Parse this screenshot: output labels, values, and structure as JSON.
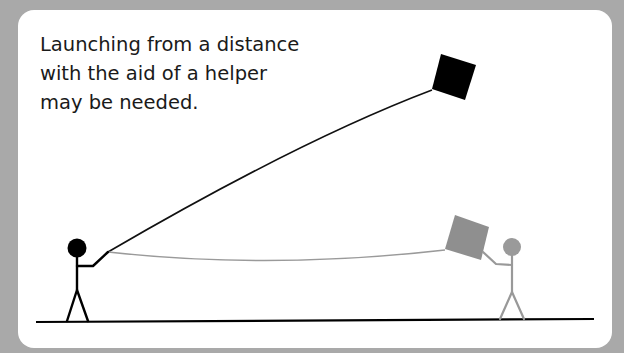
{
  "caption": {
    "lines": [
      "Launching from a distance",
      "with the aid of a helper",
      "may be needed."
    ]
  },
  "figures": {
    "launcher": {
      "label": "launcher-stick-figure",
      "color": "#000000"
    },
    "helper": {
      "label": "helper-stick-figure",
      "color": "#999999"
    }
  },
  "kites": {
    "flying": {
      "color": "#000000"
    },
    "held": {
      "color": "#8c8c8c"
    }
  },
  "colors": {
    "background": "#a9a9a9",
    "card": "#ffffff",
    "ground": "#000000"
  }
}
